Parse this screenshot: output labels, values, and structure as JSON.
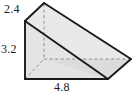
{
  "figure": {
    "name": "triangular-prism",
    "labels": {
      "top_edge": "2.4",
      "left_edge": "3.2",
      "bottom_edge": "4.8"
    },
    "colors": {
      "outline": "#1a1a1a",
      "hidden_line": "#8c8c8c",
      "face_top": "#e9e9e9",
      "face_front": "#e2e2e2",
      "face_side": "#dcdcdc",
      "background": "#ffffff",
      "text": "#1a1a1a"
    },
    "geometry": {
      "front_top_apex": [
        44,
        3
      ],
      "front_upper_left": [
        25,
        21
      ],
      "front_lower_left": [
        25,
        79
      ],
      "front_lower_right": [
        108,
        79
      ],
      "back_right_tip": [
        131,
        59
      ],
      "hidden_center": [
        44,
        59
      ],
      "hidden_vertical_from": [
        44,
        3
      ],
      "hidden_vertical_to": [
        44,
        59
      ],
      "hidden_horizontal_from": [
        44,
        59
      ],
      "hidden_horizontal_to": [
        131,
        59
      ]
    }
  }
}
